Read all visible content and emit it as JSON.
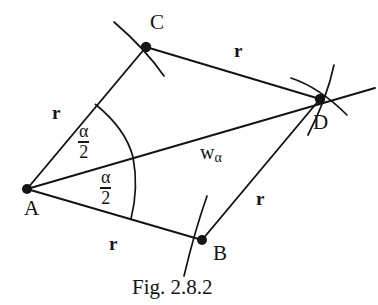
{
  "figure": {
    "caption": "Fig. 2.8.2",
    "stroke_color": "#141414",
    "background_color": "#ffffff",
    "points": [
      {
        "id": "A",
        "label": "A",
        "x": 27,
        "y": 189
      },
      {
        "id": "B",
        "label": "B",
        "x": 202,
        "y": 240
      },
      {
        "id": "C",
        "label": "C",
        "x": 146,
        "y": 47
      },
      {
        "id": "D",
        "label": "D",
        "x": 320,
        "y": 99
      }
    ],
    "segments": [
      {
        "id": "AC",
        "from": "A",
        "to": "C",
        "length_label": "r"
      },
      {
        "id": "CD",
        "from": "C",
        "to": "D",
        "length_label": "r"
      },
      {
        "id": "AB",
        "from": "A",
        "to": "B",
        "length_label": "r"
      },
      {
        "id": "BD",
        "from": "B",
        "to": "D",
        "length_label": "r"
      },
      {
        "id": "AD",
        "from": "A",
        "to": "D",
        "length_label": "w_alpha"
      }
    ],
    "length_labels": [
      {
        "for": "AC",
        "text": "r",
        "x": 52,
        "y": 103
      },
      {
        "for": "CD",
        "text": "r",
        "x": 234,
        "y": 41
      },
      {
        "for": "AB",
        "text": "r",
        "x": 109,
        "y": 234
      },
      {
        "for": "BD",
        "text": "r",
        "x": 256,
        "y": 189
      }
    ],
    "bisector_label": {
      "base": "w",
      "sub": "α",
      "x": 200,
      "y": 142
    },
    "angles": [
      {
        "id": "upper-half-angle",
        "numerator": "α",
        "denominator": "2",
        "x": 78,
        "y": 122
      },
      {
        "id": "lower-half-angle",
        "numerator": "α",
        "denominator": "2",
        "x": 100,
        "y": 168
      }
    ],
    "point_labels": [
      {
        "id": "A",
        "text": "A",
        "x": 24,
        "y": 198
      },
      {
        "id": "B",
        "text": "B",
        "x": 213,
        "y": 243
      },
      {
        "id": "C",
        "text": "C",
        "x": 150,
        "y": 12
      },
      {
        "id": "D",
        "text": "D",
        "x": 313,
        "y": 112
      }
    ]
  }
}
